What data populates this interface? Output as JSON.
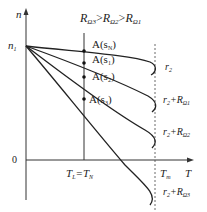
{
  "title": {
    "prefix_1": "R",
    "sub_1": "Ω3",
    "gt_1": ">",
    "prefix_2": "R",
    "sub_2": "Ω2",
    "gt_2": ">",
    "prefix_3": "R",
    "sub_3": "Ω1"
  },
  "axes": {
    "y_label": "n",
    "x_label": "T",
    "origin_label": "0",
    "n1_label": "n",
    "n1_sub": "1",
    "tl_label": "T",
    "tl_sub": "L",
    "tl_eq": "=T",
    "tn_sub": "N",
    "tm_label": "T",
    "tm_sub": "m"
  },
  "points": [
    {
      "label": "A(s",
      "sub": "N",
      "close": ")"
    },
    {
      "label": "A(s",
      "sub": "1",
      "close": ")"
    },
    {
      "label": "A(s",
      "sub": "2",
      "close": ")"
    },
    {
      "label": "A(s",
      "sub": "3",
      "close": ")"
    }
  ],
  "curves": [
    {
      "label": "r",
      "sub": "2",
      "extra": ""
    },
    {
      "label": "r",
      "sub": "2",
      "extra": "+R",
      "extra_sub": "Ω1"
    },
    {
      "label": "r",
      "sub": "2",
      "extra": "+R",
      "extra_sub": "Ω2"
    },
    {
      "label": "r",
      "sub": "2",
      "extra": "+R",
      "extra_sub": "Ω3"
    }
  ]
}
